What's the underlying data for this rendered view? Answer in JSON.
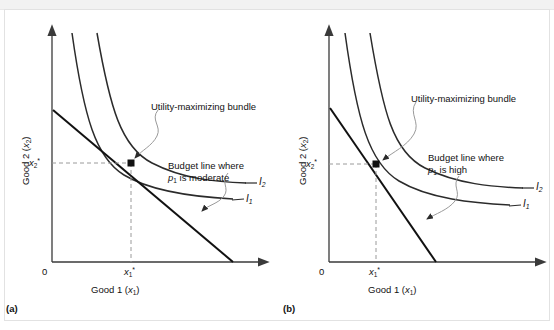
{
  "figure": {
    "type": "economics-diagram",
    "panels": [
      {
        "id": "a",
        "panel_label": "(a)",
        "x_axis_label": "Good 1 (x₁)",
        "y_axis_label": "Good 2 (x₂)",
        "origin_label": "0",
        "x_optimum_tick": "x₁*",
        "y_optimum_tick": "x₂*",
        "annotation_bundle": "Utility-maximizing bundle",
        "annotation_budget_line_1": "Budget line where",
        "annotation_budget_line_2": "p₁ is moderate",
        "curve_label_lower": "I₁",
        "curve_label_upper": "I₂",
        "budget_slope_description": "moderate",
        "geometry": {
          "axis_x": 52,
          "axis_y_top": 30,
          "axis_y_bottom": 262,
          "axis_x_end": 268,
          "budget_y_intercept": 110,
          "budget_x_intercept": 233,
          "optimum_x": 131,
          "optimum_y": 163
        }
      },
      {
        "id": "b",
        "panel_label": "(b)",
        "x_axis_label": "Good 1 (x₁)",
        "y_axis_label": "Good 2 (x₂)",
        "origin_label": "0",
        "x_optimum_tick": "x₁*",
        "y_optimum_tick": "x₂*",
        "annotation_bundle": "Utility-maximizing bundle",
        "annotation_budget_line_1": "Budget line where",
        "annotation_budget_line_2": "p₁ is high",
        "curve_label_lower": "I₁",
        "curve_label_upper": "I₂",
        "budget_slope_description": "high",
        "geometry": {
          "axis_x": 329,
          "axis_y_top": 30,
          "axis_y_bottom": 262,
          "axis_x_end": 545,
          "budget_y_intercept": 108,
          "budget_x_intercept": 436,
          "optimum_x": 376,
          "optimum_y": 164
        }
      }
    ],
    "colors": {
      "curve": "#2b2b2b",
      "budget_line": "#111111",
      "axis": "#3a3a3a",
      "guide_dashed": "#9a9a9a",
      "leader": "#9a9a9a",
      "frame": "#e2e2e2",
      "top_band": "#f2f2f2"
    }
  }
}
